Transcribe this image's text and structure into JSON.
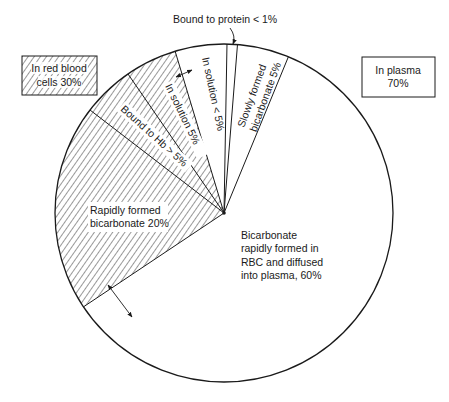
{
  "chart_data": {
    "type": "pie",
    "title": "",
    "groups": [
      {
        "name": "In red blood cells",
        "percent_label": "In red blood cells 30%",
        "value": 30,
        "pattern": "hatched"
      },
      {
        "name": "In plasma",
        "percent_label": "In plasma 70%",
        "value": 70,
        "pattern": "plain"
      }
    ],
    "slices": [
      {
        "id": "slowly-formed-bicarbonate",
        "group": "In plasma",
        "label_lines": [
          "Slowly formed",
          "bicarbonate 5%"
        ],
        "value": 5,
        "value_text": "5%"
      },
      {
        "id": "bound-to-protein",
        "group": "In plasma",
        "label_lines": [
          "Bound to protein < 1%"
        ],
        "value": 1,
        "value_text": "< 1%"
      },
      {
        "id": "in-solution-plasma",
        "group": "In plasma",
        "label_lines": [
          "In solution < 5%"
        ],
        "value": 5,
        "value_text": "< 5%"
      },
      {
        "id": "in-solution-rbc",
        "group": "In red blood cells",
        "label_lines": [
          "In solution 5%"
        ],
        "value": 5,
        "value_text": "5%"
      },
      {
        "id": "bound-to-hb",
        "group": "In red blood cells",
        "label_lines": [
          "Bound to Hb > 5%"
        ],
        "value": 5,
        "value_text": "> 5%"
      },
      {
        "id": "rapidly-formed-bicarbonate",
        "group": "In red blood cells",
        "label_lines": [
          "Rapidly formed",
          "bicarbonate 20%"
        ],
        "value": 20,
        "value_text": "20%"
      },
      {
        "id": "bicarbonate-diffused-into-plasma",
        "group": "In plasma",
        "label_lines": [
          "Bicarbonate",
          "rapidly formed in",
          "RBC and diffused",
          "into plasma, 60%"
        ],
        "value": 60,
        "value_text": "60%"
      }
    ],
    "legend": [
      {
        "label_lines": [
          "In red blood",
          "cells 30%"
        ],
        "pattern": "hatched",
        "position": "top-left"
      },
      {
        "label_lines": [
          "In plasma",
          "70%"
        ],
        "pattern": "plain",
        "position": "top-right"
      }
    ],
    "annotations": [
      {
        "text": "Bound to protein < 1%",
        "pointer": "arrow-to-rim"
      },
      {
        "type": "double-arrow",
        "meaning": "exchange between rapidly formed bicarbonate in RBC and plasma"
      },
      {
        "type": "double-arrow",
        "meaning": "exchange between in solution RBC and plasma"
      }
    ],
    "colors": {
      "line": "#1a1a1a",
      "background": "#ffffff",
      "hatch": "#333333"
    }
  }
}
